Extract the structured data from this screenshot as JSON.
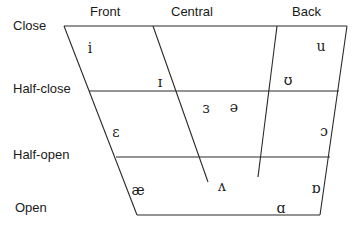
{
  "diagram": {
    "columns": [
      {
        "label": "Front",
        "x": 90,
        "y": 11
      },
      {
        "label": "Central",
        "x": 171,
        "y": 11
      },
      {
        "label": "Back",
        "x": 292,
        "y": 11
      }
    ],
    "rows": [
      {
        "label": "Close",
        "x": 13,
        "y": 25
      },
      {
        "label": "Half-close",
        "x": 13,
        "y": 88
      },
      {
        "label": "Half-open",
        "x": 13,
        "y": 154
      },
      {
        "label": "Open",
        "x": 15,
        "y": 207
      }
    ],
    "lines": [
      {
        "name": "close-line",
        "x1": 64,
        "y1": 26,
        "x2": 347,
        "y2": 26
      },
      {
        "name": "half-close-line",
        "x1": 89,
        "y1": 91,
        "x2": 339,
        "y2": 91
      },
      {
        "name": "half-open-line",
        "x1": 116,
        "y1": 157,
        "x2": 330,
        "y2": 157
      },
      {
        "name": "open-line",
        "x1": 137,
        "y1": 215,
        "x2": 320,
        "y2": 215
      },
      {
        "name": "front-edge",
        "x1": 64,
        "y1": 26,
        "x2": 137,
        "y2": 215
      },
      {
        "name": "back-edge",
        "x1": 347,
        "y1": 26,
        "x2": 320,
        "y2": 215
      },
      {
        "name": "central-left-line",
        "x1": 153,
        "y1": 26,
        "x2": 208,
        "y2": 182
      },
      {
        "name": "central-right-line",
        "x1": 277,
        "y1": 26,
        "x2": 258,
        "y2": 177
      }
    ],
    "vowels": [
      {
        "symbol": "i",
        "x": 90,
        "y": 48
      },
      {
        "symbol": "u",
        "x": 321,
        "y": 46
      },
      {
        "symbol": "ɪ",
        "x": 160,
        "y": 82
      },
      {
        "symbol": "ʊ",
        "x": 288,
        "y": 80
      },
      {
        "symbol": "ɜ",
        "x": 206,
        "y": 108
      },
      {
        "symbol": "ə",
        "x": 234,
        "y": 107
      },
      {
        "symbol": "ɛ",
        "x": 116,
        "y": 132
      },
      {
        "symbol": "ɔ",
        "x": 324,
        "y": 131
      },
      {
        "symbol": "æ",
        "x": 138,
        "y": 190
      },
      {
        "symbol": "ʌ",
        "x": 222,
        "y": 186
      },
      {
        "symbol": "ɒ",
        "x": 316,
        "y": 188
      },
      {
        "symbol": "ɑ",
        "x": 281,
        "y": 208
      }
    ]
  }
}
